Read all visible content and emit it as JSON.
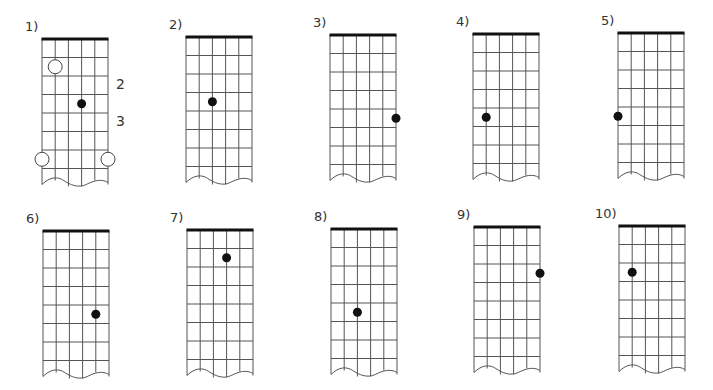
{
  "worksheet": {
    "strings": 6,
    "frets_shown": 7,
    "colors": {
      "grid": "#555555",
      "nut": "#111111",
      "dot": "#111111",
      "open_circle_fill": "#ffffff"
    },
    "diagrams": [
      {
        "label": "1)",
        "nut": {
          "x": 42,
          "y": 39
        },
        "dots": [
          {
            "string": 4,
            "row": 4
          }
        ],
        "open_circles": [
          {
            "string": 2,
            "row": 2
          },
          {
            "string": 1,
            "row": 7
          },
          {
            "string": 6,
            "row": 7
          }
        ],
        "side_labels": [
          {
            "text": "2",
            "row": 3
          },
          {
            "text": "3",
            "row": 5
          }
        ]
      },
      {
        "label": "2)",
        "nut": {
          "x": 186,
          "y": 37
        },
        "dots": [
          {
            "string": 3,
            "row": 4
          }
        ]
      },
      {
        "label": "3)",
        "nut": {
          "x": 330,
          "y": 35
        },
        "dots": [
          {
            "string": 6,
            "row": 5
          }
        ]
      },
      {
        "label": "4)",
        "nut": {
          "x": 473,
          "y": 34
        },
        "dots": [
          {
            "string": 2,
            "row": 5
          }
        ]
      },
      {
        "label": "5)",
        "nut": {
          "x": 618,
          "y": 33
        },
        "dots": [
          {
            "string": 1,
            "row": 5
          }
        ]
      },
      {
        "label": "6)",
        "nut": {
          "x": 43,
          "y": 231
        },
        "dots": [
          {
            "string": 5,
            "row": 5
          }
        ]
      },
      {
        "label": "7)",
        "nut": {
          "x": 187,
          "y": 230
        },
        "dots": [
          {
            "string": 4,
            "row": 2
          }
        ]
      },
      {
        "label": "8)",
        "nut": {
          "x": 331,
          "y": 229
        },
        "dots": [
          {
            "string": 3,
            "row": 5
          }
        ]
      },
      {
        "label": "9)",
        "nut": {
          "x": 474,
          "y": 227
        },
        "dots": [
          {
            "string": 6,
            "row": 3
          }
        ]
      },
      {
        "label": "10)",
        "nut": {
          "x": 619,
          "y": 226
        },
        "dots": [
          {
            "string": 2,
            "row": 3
          }
        ]
      }
    ]
  }
}
